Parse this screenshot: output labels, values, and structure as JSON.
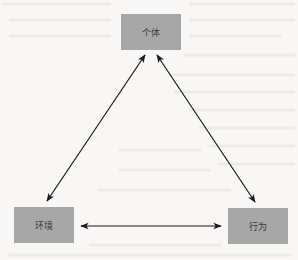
{
  "diagram": {
    "type": "triangle-relationship",
    "nodes": [
      {
        "id": "individual",
        "label": "个体",
        "x": 121,
        "y": 14
      },
      {
        "id": "environment",
        "label": "环境",
        "x": 14,
        "y": 207
      },
      {
        "id": "behavior",
        "label": "行为",
        "x": 228,
        "y": 208
      }
    ],
    "edges": [
      {
        "from": "individual",
        "to": "environment",
        "bidirectional": true
      },
      {
        "from": "individual",
        "to": "behavior",
        "bidirectional": true
      },
      {
        "from": "environment",
        "to": "behavior",
        "bidirectional": true
      }
    ],
    "colors": {
      "node_fill": "#a7a7a7",
      "arrow": "#1a1a1a",
      "background": "#f8f7f5"
    }
  }
}
